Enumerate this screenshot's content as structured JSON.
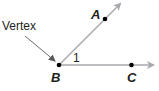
{
  "diagram": {
    "labels": {
      "vertex": "Vertex",
      "point_a": "A",
      "point_b": "B",
      "point_c": "C",
      "angle": "1"
    },
    "colors": {
      "ray": "#a7a9ac",
      "point": "#000000",
      "text": "#231f20",
      "pointer_arrow": "#58595b"
    }
  }
}
